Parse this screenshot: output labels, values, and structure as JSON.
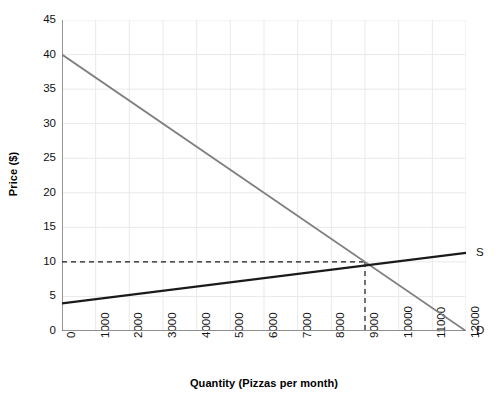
{
  "chart_data": {
    "type": "line",
    "title": "",
    "xlabel": "Quantity (Pizzas per month)",
    "ylabel": "Price ($)",
    "xlim": [
      0,
      12000
    ],
    "ylim": [
      0,
      45
    ],
    "grid": true,
    "legend_position": "inline-right-end",
    "xticks": [
      "0",
      "1000",
      "2000",
      "3000",
      "4000",
      "5000",
      "6000",
      "7000",
      "8000",
      "9000",
      "10000",
      "11000",
      "12000"
    ],
    "yticks": [
      "0",
      "5",
      "10",
      "15",
      "20",
      "25",
      "30",
      "35",
      "40",
      "45"
    ],
    "series": [
      {
        "name": "D",
        "label": "D",
        "color": "#808080",
        "style": "solid",
        "x": [
          0,
          12000
        ],
        "values": [
          40,
          0
        ]
      },
      {
        "name": "S",
        "label": "S",
        "color": "#1a1a1a",
        "style": "solid",
        "x": [
          0,
          12000
        ],
        "values": [
          4,
          11.3
        ]
      }
    ],
    "annotations": [
      {
        "name": "equilibrium",
        "type": "dashed-guideline",
        "price": 10,
        "quantity": 9000,
        "color": "#1a1a1a"
      }
    ]
  },
  "colors": {
    "demand": "#808080",
    "supply": "#1a1a1a",
    "grid": "#e9e9ec",
    "axis": "#6e6e6e",
    "text": "#111111"
  }
}
